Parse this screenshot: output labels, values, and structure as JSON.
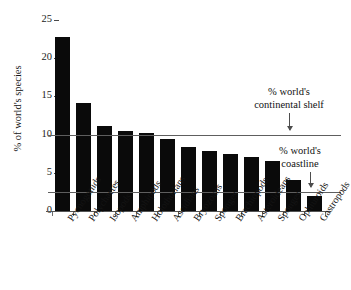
{
  "chart_data": {
    "type": "bar",
    "title": "",
    "xlabel": "",
    "ylabel": "% of world's species",
    "ylim": [
      0,
      25
    ],
    "yticks": [
      0,
      5,
      10,
      15,
      20,
      25
    ],
    "ytick_labels": [
      "0",
      "5",
      "10",
      "15",
      "20",
      "25"
    ],
    "grid": false,
    "legend": "none",
    "categories": [
      "Pycnogonids",
      "Polychaetes",
      "Isopods",
      "Amphipods",
      "Holothurians",
      "Ascidians",
      "Bryozoans",
      "Sponges",
      "Brachiopods",
      "Asteroideans",
      "Sponges",
      "Ophiuroids",
      "Gastropods"
    ],
    "values": [
      22.8,
      14.2,
      11.1,
      10.5,
      10.2,
      9.4,
      8.4,
      7.9,
      7.4,
      7.1,
      6.5,
      4.1,
      2.0
    ],
    "bar_color": "#0a0a0a",
    "reference_lines": [
      {
        "name": "continental-shelf",
        "value": 10.0,
        "label_line_1": "% world's",
        "label_line_2": "continental shelf",
        "color": "#5e5e5e"
      },
      {
        "name": "coastline",
        "value": 2.5,
        "label_line_1": "% world's",
        "label_line_2": "coastline",
        "color": "#5e5e5e"
      }
    ]
  },
  "annotations": {
    "shelf": {
      "line1": "% world's",
      "line2": "continental shelf"
    },
    "coastline": {
      "line1": "% world's",
      "line2": "coastline"
    }
  }
}
